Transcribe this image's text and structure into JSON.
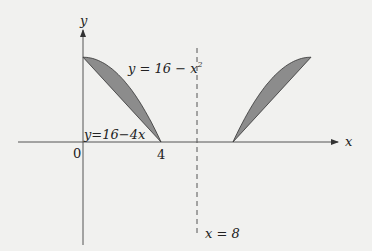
{
  "diagram": {
    "axes": {
      "x_label": "x",
      "y_label": "y",
      "origin_label": "0",
      "tick_label_4": "4"
    },
    "curve_labels": {
      "parabola": "y = 16 − x²",
      "line": "y=16−4x"
    },
    "parabola_label_main": "y = 16 − x",
    "parabola_label_sup": "2",
    "dashed_line_label": "x = 8",
    "colors": {
      "fill": "#8c8c8c",
      "stroke": "#333333",
      "dashed": "#555555"
    }
  }
}
